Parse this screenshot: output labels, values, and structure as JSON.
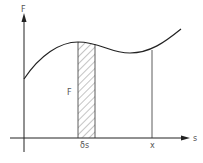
{
  "diagram": {
    "axis_y_label": "F",
    "axis_x_label": "s",
    "strip_label": "F",
    "strip_width_label": "δs",
    "x_mark_label": "x",
    "colors": {
      "line": "#222222",
      "hatch": "#555555"
    }
  }
}
